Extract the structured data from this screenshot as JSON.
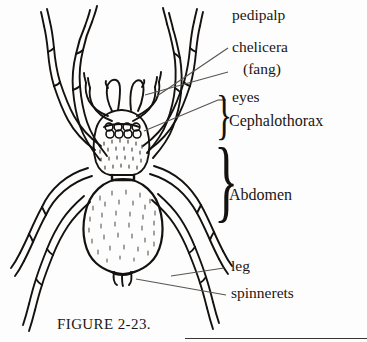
{
  "figure": {
    "caption": "FIGURE 2-23.",
    "ink_color": "#14110f",
    "background_color": "#fdfdfd",
    "leader_line_color": "#5a5550"
  },
  "labels": {
    "pedipalp": "pedipalp",
    "chelicera": "chelicera",
    "fang": "(fang)",
    "eyes": "eyes",
    "cephalothorax": "Cephalothorax",
    "abdomen": "Abdomen",
    "leg": "leg",
    "spinnerets": "spinnerets"
  },
  "braces": {
    "cephalothorax": "}",
    "abdomen": "}"
  },
  "anatomy": {
    "eye_count": 8,
    "leg_count": 8,
    "pedipalp_count": 2,
    "chelicera_count": 2
  }
}
